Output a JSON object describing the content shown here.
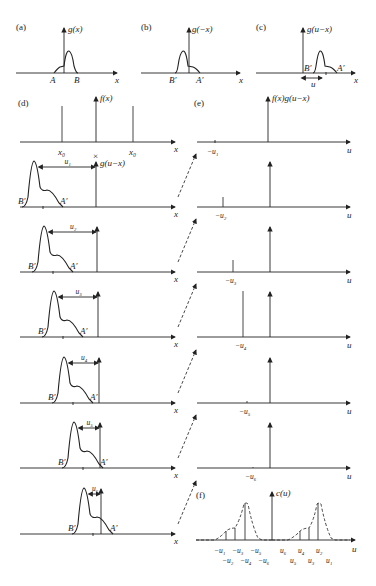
{
  "panels": {
    "a": {
      "label": "(a)",
      "ylabel": "g(x)",
      "xlabel": "x",
      "points": [
        "A",
        "B"
      ]
    },
    "b": {
      "label": "(b)",
      "ylabel": "g(−x)",
      "xlabel": "x",
      "points": [
        "B′",
        "A′"
      ]
    },
    "c": {
      "label": "(c)",
      "ylabel": "g(u−x)",
      "xlabel": "x",
      "points": [
        "B′",
        "A′"
      ],
      "shift": "u"
    },
    "d": {
      "label": "(d)",
      "ylabel": "f(x)",
      "xlabel": "x",
      "ticks": [
        "x₀",
        "x₀"
      ],
      "center_mark": "×",
      "g_label": "g(u−x)"
    },
    "e": {
      "label": "(e)",
      "ylabel": "f(x)g(u−x)",
      "xlabel": "u"
    },
    "f": {
      "label": "(f)",
      "ylabel": "c(u)",
      "xlabel": "u",
      "neg_ticks_top": [
        "−u₁",
        "−u₃",
        "−u₅"
      ],
      "neg_ticks_bottom": [
        "−u₂",
        "−u₄",
        "−u₆"
      ],
      "pos_ticks_top": [
        "u₆",
        "u₄",
        "u₂"
      ],
      "pos_ticks_bottom": [
        "u₅",
        "u₃",
        "u₁"
      ]
    }
  },
  "steps": [
    {
      "shift": "u₁",
      "neg": "−u₁",
      "B": "B′",
      "A": "A′",
      "x": "x",
      "u": "u"
    },
    {
      "shift": "u₂",
      "neg": "−u₂",
      "B": "B′",
      "A": "A′",
      "x": "x",
      "u": "u"
    },
    {
      "shift": "u₃",
      "neg": "−u₃",
      "B": "B′",
      "A": "A′",
      "x": "x",
      "u": "u"
    },
    {
      "shift": "u₄",
      "neg": "−u₄",
      "B": "B′",
      "A": "A′",
      "x": "x",
      "u": "u"
    },
    {
      "shift": "u₅",
      "neg": "−u₅",
      "B": "B′",
      "A": "A′",
      "x": "x",
      "u": "u"
    },
    {
      "shift": "u₆",
      "neg": "−u₆",
      "B": "B′",
      "A": "A′",
      "x": "x",
      "u": "u"
    }
  ]
}
